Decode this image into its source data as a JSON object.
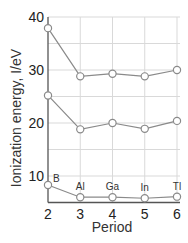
{
  "chart_data": {
    "type": "line",
    "title": "",
    "xlabel": "Period",
    "ylabel": "Ionization energy, I/eV",
    "x": [
      2,
      3,
      4,
      5,
      6
    ],
    "x_ticks": [
      "2",
      "3",
      "4",
      "5",
      "6"
    ],
    "y_ticks": [
      "10",
      "20",
      "30",
      "40"
    ],
    "ylim": [
      5,
      40
    ],
    "xlim": [
      2,
      6
    ],
    "grid": true,
    "element_labels": [
      "B",
      "Al",
      "Ga",
      "In",
      "Tl"
    ],
    "series": [
      {
        "name": "First ionization energy",
        "values": [
          8.3,
          6.0,
          6.0,
          5.8,
          6.1
        ]
      },
      {
        "name": "Second ionization energy",
        "values": [
          25.2,
          18.8,
          20.0,
          18.9,
          20.4
        ]
      },
      {
        "name": "Third ionization energy",
        "values": [
          37.9,
          28.8,
          29.3,
          28.8,
          30.0
        ]
      }
    ],
    "colors": {
      "line": "#8a8a8a",
      "marker_fill": "#ffffff",
      "marker_stroke": "#8a8a8a",
      "grid": "#d9d9d9",
      "axis": "#555555"
    }
  }
}
